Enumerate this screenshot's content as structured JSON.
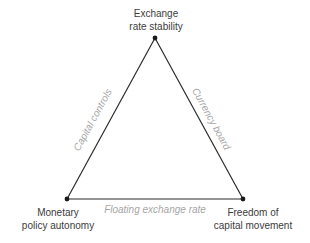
{
  "diagram": {
    "colors": {
      "background": "#ffffff",
      "line": "#2b2b2b",
      "vertex_dot": "#1a1a1a",
      "vertex_label": "#3c3c3c",
      "edge_label": "#a6a6a6"
    },
    "vertices": {
      "top": {
        "line1": "Exchange",
        "line2": "rate stability"
      },
      "bottom_left": {
        "line1": "Monetary",
        "line2": "policy autonomy"
      },
      "bottom_right": {
        "line1": "Freedom of",
        "line2": "capital movement"
      }
    },
    "edges": {
      "left": {
        "label": "Capital controls"
      },
      "right": {
        "label": "Currency board"
      },
      "bottom": {
        "label": "Floating exchange rate"
      }
    }
  }
}
